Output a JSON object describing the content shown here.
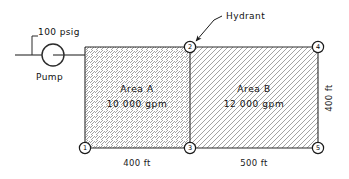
{
  "diagram": {
    "pump": {
      "label": "Pump",
      "pressure_label": "100 psig",
      "icon": "pump-circle-icon"
    },
    "annotation": {
      "hydrant_label": "Hydrant",
      "leader_icon": "arrow-leader-icon"
    },
    "areas": [
      {
        "id": "A",
        "name_label": "Area  A",
        "flow_label": "10 000  gpm",
        "hatch": "forward-slash"
      },
      {
        "id": "B",
        "name_label": "Area  B",
        "flow_label": "12 000  gpm",
        "hatch": "back-slash"
      }
    ],
    "nodes": [
      {
        "id": "1",
        "label": "1"
      },
      {
        "id": "2",
        "label": "2"
      },
      {
        "id": "3",
        "label": "3"
      },
      {
        "id": "4",
        "label": "4"
      },
      {
        "id": "5",
        "label": "5"
      }
    ],
    "dimensions": [
      {
        "id": "bottom-left",
        "label": "400 ft"
      },
      {
        "id": "bottom-right",
        "label": "500 ft"
      },
      {
        "id": "right-side",
        "label": "400 ft"
      }
    ],
    "colors": {
      "line": "#2b2b2b",
      "text": "#111111",
      "hatch": "#8c8c8c",
      "background": "#ffffff"
    }
  }
}
